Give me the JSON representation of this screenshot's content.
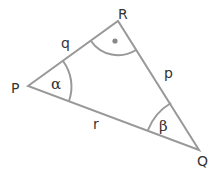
{
  "diagram": {
    "type": "triangle",
    "stroke_color": "#999999",
    "label_color": "#333333",
    "vertices": [
      {
        "name": "P",
        "x": 28,
        "y": 86
      },
      {
        "name": "R",
        "x": 118,
        "y": 21
      },
      {
        "name": "Q",
        "x": 199,
        "y": 150
      }
    ],
    "vertex_labels": {
      "P": "P",
      "R": "R",
      "Q": "Q"
    },
    "side_labels": {
      "q": "q",
      "p": "p",
      "r": "r"
    },
    "angle_labels": {
      "alpha": "α",
      "beta": "β"
    },
    "right_angle_marker": "dot at R"
  }
}
